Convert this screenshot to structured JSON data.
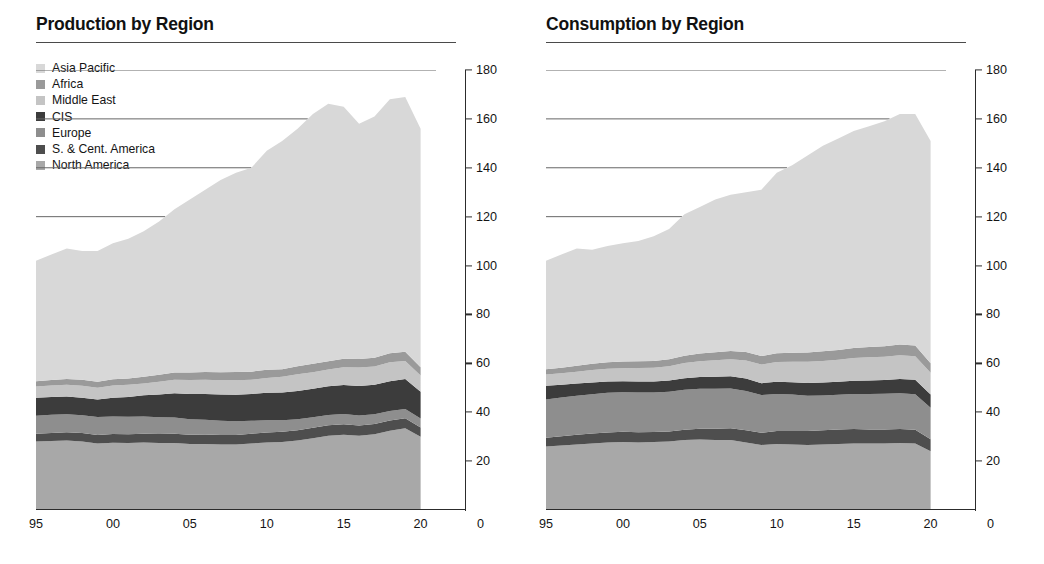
{
  "figure": {
    "panels": [
      {
        "title": "Production by Region",
        "has_legend": true
      },
      {
        "title": "Consumption by Region",
        "has_legend": false
      }
    ]
  },
  "legend": {
    "items": [
      {
        "label": "Asia Pacific",
        "color": "#d8d8d8"
      },
      {
        "label": "Africa",
        "color": "#9a9a9a"
      },
      {
        "label": "Middle East",
        "color": "#c4c4c4"
      },
      {
        "label": "CIS",
        "color": "#3c3c3c"
      },
      {
        "label": "Europe",
        "color": "#8e8e8e"
      },
      {
        "label": "S. & Cent. America",
        "color": "#4e4e4e"
      },
      {
        "label": "North America",
        "color": "#a8a8a8"
      }
    ]
  },
  "axes": {
    "y_ticks": [
      "180",
      "160",
      "140",
      "120",
      "100",
      "80",
      "60",
      "40",
      "20"
    ],
    "y_tick_values": [
      180,
      160,
      140,
      120,
      100,
      80,
      60,
      40,
      20
    ],
    "x_ticks": [
      "95",
      "00",
      "05",
      "10",
      "15",
      "20"
    ],
    "x_tick_values": [
      1995,
      2000,
      2005,
      2010,
      2015,
      2020
    ],
    "x_zero_label": "0",
    "ylim": [
      0,
      180
    ],
    "xlim": [
      1995,
      2021
    ]
  },
  "chart_data": {
    "type": "area",
    "xlabel": "",
    "ylabel": "",
    "ylim": [
      0,
      180
    ],
    "grid": "horizontal-partial",
    "legend_position": "top-left",
    "stack_order_bottom_to_top": [
      "North America",
      "S. & Cent. America",
      "Europe",
      "CIS",
      "Middle East",
      "Africa",
      "Asia Pacific"
    ],
    "x": [
      1995,
      1996,
      1997,
      1998,
      1999,
      2000,
      2001,
      2002,
      2003,
      2004,
      2005,
      2006,
      2007,
      2008,
      2009,
      2010,
      2011,
      2012,
      2013,
      2014,
      2015,
      2016,
      2017,
      2018,
      2019,
      2020
    ],
    "charts": [
      {
        "name": "Production by Region",
        "series": [
          {
            "name": "North America",
            "color": "#a8a8a8",
            "values": [
              28.0,
              28.2,
              28.4,
              28.0,
              27.2,
              27.5,
              27.4,
              27.6,
              27.4,
              27.4,
              27.0,
              27.0,
              26.8,
              26.8,
              27.2,
              27.6,
              27.8,
              28.4,
              29.4,
              30.4,
              30.8,
              30.4,
              31.0,
              32.4,
              33.4,
              30.0
            ]
          },
          {
            "name": "S. & Cent. America",
            "color": "#4e4e4e",
            "values": [
              3.2,
              3.3,
              3.4,
              3.5,
              3.5,
              3.6,
              3.6,
              3.6,
              3.7,
              3.8,
              3.8,
              3.9,
              3.9,
              3.9,
              4.0,
              4.1,
              4.2,
              4.2,
              4.2,
              4.3,
              4.3,
              4.2,
              4.2,
              4.2,
              4.1,
              3.8
            ]
          },
          {
            "name": "Europe",
            "color": "#8e8e8e",
            "values": [
              7.4,
              7.5,
              7.4,
              7.3,
              7.3,
              7.2,
              7.1,
              7.0,
              6.8,
              6.6,
              6.3,
              6.0,
              5.8,
              5.6,
              5.3,
              5.0,
              4.7,
              4.5,
              4.3,
              4.2,
              4.2,
              4.1,
              4.0,
              3.9,
              3.8,
              3.6
            ]
          },
          {
            "name": "CIS",
            "color": "#3c3c3c",
            "values": [
              7.3,
              7.2,
              7.2,
              7.1,
              7.2,
              7.6,
              8.1,
              8.7,
              9.4,
              10.0,
              10.4,
              10.6,
              10.8,
              10.8,
              11.0,
              11.3,
              11.4,
              11.6,
              11.7,
              11.7,
              11.8,
              12.0,
              12.0,
              12.2,
              12.3,
              11.0
            ]
          },
          {
            "name": "Middle East",
            "color": "#c4c4c4",
            "values": [
              4.6,
              4.7,
              4.8,
              4.9,
              4.8,
              5.0,
              5.0,
              4.9,
              5.2,
              5.5,
              5.7,
              5.8,
              5.8,
              6.0,
              5.8,
              6.0,
              6.4,
              6.8,
              6.8,
              6.9,
              7.3,
              7.6,
              7.5,
              7.7,
              7.4,
              6.6
            ]
          },
          {
            "name": "Africa",
            "color": "#9a9a9a",
            "values": [
              2.2,
              2.3,
              2.4,
              2.5,
              2.5,
              2.6,
              2.6,
              2.7,
              2.8,
              3.0,
              3.1,
              3.2,
              3.3,
              3.4,
              3.3,
              3.4,
              3.1,
              3.3,
              3.4,
              3.4,
              3.5,
              3.5,
              3.6,
              3.7,
              3.7,
              3.4
            ]
          },
          {
            "name": "Asia Pacific",
            "color": "#d8d8d8",
            "values": [
              49.3,
              51.3,
              53.4,
              52.7,
              53.5,
              55.6,
              57.2,
              59.5,
              62.7,
              66.7,
              70.7,
              74.5,
              78.6,
              81.5,
              83.4,
              89.6,
              93.4,
              97.2,
              102.2,
              105.3,
              103.1,
              96.2,
              98.7,
              103.9,
              104.3,
              97.6
            ]
          }
        ],
        "totals": [
          102.0,
          104.5,
          107.0,
          106.0,
          106.0,
          109.1,
          110.9,
          114.0,
          118.0,
          123.0,
          127.0,
          131.0,
          133.0,
          136.0,
          140.0,
          147.0,
          151.0,
          156.0,
          162.0,
          166.2,
          165.0,
          158.0,
          161.0,
          168.0,
          169.0,
          156.0
        ]
      },
      {
        "name": "Consumption by Region",
        "series": [
          {
            "name": "North America",
            "color": "#a8a8a8",
            "values": [
              26.0,
              26.4,
              26.8,
              27.2,
              27.6,
              27.8,
              27.6,
              27.8,
              28.0,
              28.6,
              28.8,
              28.6,
              28.6,
              27.6,
              26.6,
              27.0,
              26.8,
              26.6,
              26.8,
              27.0,
              27.2,
              27.2,
              27.2,
              27.4,
              27.2,
              24.0
            ]
          },
          {
            "name": "S. & Cent. America",
            "color": "#4e4e4e",
            "values": [
              3.6,
              3.8,
              4.0,
              4.1,
              4.1,
              4.2,
              4.2,
              4.1,
              4.1,
              4.2,
              4.4,
              4.6,
              4.8,
              5.0,
              5.0,
              5.3,
              5.5,
              5.7,
              5.8,
              5.9,
              5.9,
              5.7,
              5.7,
              5.7,
              5.6,
              4.9
            ]
          },
          {
            "name": "Europe",
            "color": "#8e8e8e",
            "values": [
              15.6,
              15.8,
              15.9,
              16.1,
              16.3,
              16.2,
              16.3,
              16.2,
              16.3,
              16.4,
              16.4,
              16.4,
              16.3,
              16.1,
              15.4,
              15.2,
              14.9,
              14.4,
              14.2,
              14.2,
              14.4,
              14.6,
              14.7,
              14.7,
              14.6,
              12.9
            ]
          },
          {
            "name": "CIS",
            "color": "#3c3c3c",
            "values": [
              5.6,
              5.2,
              5.0,
              4.8,
              4.6,
              4.5,
              4.5,
              4.5,
              4.6,
              4.7,
              4.8,
              4.9,
              5.0,
              5.1,
              4.9,
              5.0,
              5.1,
              5.3,
              5.4,
              5.4,
              5.4,
              5.5,
              5.6,
              5.8,
              5.9,
              5.4
            ]
          },
          {
            "name": "Middle East",
            "color": "#c4c4c4",
            "values": [
              4.6,
              4.7,
              4.9,
              5.1,
              5.2,
              5.3,
              5.5,
              5.6,
              5.8,
              6.2,
              6.5,
              6.8,
              7.0,
              7.4,
              7.6,
              8.0,
              8.3,
              8.6,
              8.8,
              9.0,
              9.3,
              9.5,
              9.5,
              9.7,
              9.6,
              8.9
            ]
          },
          {
            "name": "Africa",
            "color": "#9a9a9a",
            "values": [
              2.2,
              2.3,
              2.4,
              2.5,
              2.6,
              2.7,
              2.8,
              2.8,
              2.9,
              3.0,
              3.1,
              3.2,
              3.3,
              3.4,
              3.5,
              3.6,
              3.7,
              3.8,
              3.9,
              4.0,
              4.1,
              4.2,
              4.3,
              4.4,
              4.4,
              3.9
            ]
          },
          {
            "name": "Asia Pacific",
            "color": "#d8d8d8",
            "values": [
              44.4,
              46.3,
              48.0,
              46.7,
              47.6,
              48.4,
              49.1,
              51.0,
              53.3,
              57.9,
              60.0,
              62.5,
              64.0,
              65.4,
              68.0,
              73.9,
              76.7,
              80.6,
              84.1,
              86.5,
              88.7,
              90.3,
              92.0,
              94.3,
              94.7,
              91.0
            ]
          }
        ],
        "totals": [
          102.0,
          104.5,
          107.0,
          106.5,
          108.0,
          109.1,
          110.0,
          112.0,
          115.0,
          121.0,
          124.0,
          127.0,
          129.0,
          130.0,
          131.0,
          138.0,
          141.0,
          145.0,
          149.0,
          152.0,
          155.0,
          157.0,
          159.0,
          162.0,
          162.0,
          151.0
        ]
      }
    ]
  }
}
